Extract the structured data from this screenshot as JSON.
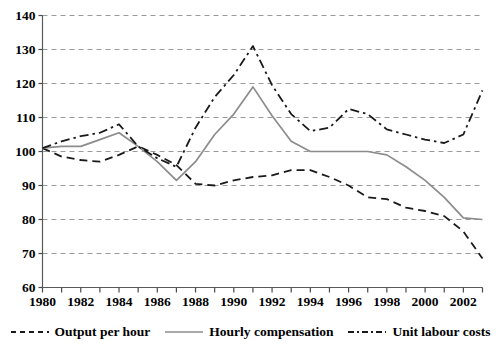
{
  "chart_data": {
    "type": "line",
    "title": "",
    "subtitle": "",
    "xlabel": "",
    "ylabel": "",
    "xlim": [
      1980,
      2003
    ],
    "ylim": [
      60,
      140
    ],
    "ytick_values": [
      60,
      70,
      80,
      90,
      100,
      110,
      120,
      130,
      140
    ],
    "ytick_labels": [
      "60",
      "70",
      "80",
      "90",
      "100",
      "110",
      "120",
      "130",
      "140"
    ],
    "xtick_values": [
      1980,
      1982,
      1984,
      1986,
      1988,
      1990,
      1992,
      1994,
      1996,
      1998,
      2000,
      2002
    ],
    "xtick_labels": [
      "1980",
      "1982",
      "1984",
      "1986",
      "1988",
      "1990",
      "1992",
      "1994",
      "1996",
      "1998",
      "2000",
      "2002"
    ],
    "x": [
      1980,
      1981,
      1982,
      1983,
      1984,
      1985,
      1986,
      1987,
      1988,
      1989,
      1990,
      1991,
      1992,
      1993,
      1994,
      1995,
      1996,
      1997,
      1998,
      1999,
      2000,
      2001,
      2002,
      2003
    ],
    "grid": true,
    "grid_axis": "y",
    "grid_style": "dashed",
    "legend_position": "bottom",
    "series": [
      {
        "name": "Output per hour",
        "style": "dashed",
        "color": "#1a1a1a",
        "values": [
          101,
          98.5,
          97.5,
          97,
          99,
          101.5,
          99,
          96,
          90.5,
          90,
          91.5,
          92.5,
          93,
          94.5,
          94.5,
          92.5,
          90,
          86.5,
          86,
          83.5,
          82.5,
          81,
          76.5,
          68.5
        ]
      },
      {
        "name": "Hourly compensation",
        "style": "solid",
        "color": "#8c8c8c",
        "values": [
          101,
          101.5,
          101.5,
          103.5,
          105.5,
          101.5,
          97,
          91.5,
          97,
          105,
          111,
          119,
          110.5,
          103,
          100,
          100,
          100,
          100,
          99,
          95.5,
          91.5,
          86.5,
          80.5,
          80
        ]
      },
      {
        "name": "Unit labour costs",
        "style": "dashdot",
        "color": "#1a1a1a",
        "values": [
          101,
          103,
          104.5,
          105.5,
          108,
          101.5,
          98,
          95.5,
          107,
          116,
          122.5,
          131,
          119.5,
          111,
          106,
          107,
          112.5,
          111,
          106.5,
          105,
          103.5,
          102.5,
          105,
          118
        ]
      }
    ]
  },
  "legend": {
    "items": [
      {
        "label": "Output per hour",
        "style": "dashed",
        "color": "#1a1a1a"
      },
      {
        "label": "Hourly compensation",
        "style": "solid",
        "color": "#8c8c8c"
      },
      {
        "label": "Unit labour costs",
        "style": "dashdot",
        "color": "#1a1a1a"
      }
    ]
  },
  "axes": {
    "frame_color": "#5a5a5a",
    "grid_color": "#9a9a9a",
    "tick_color": "#4a4a4a"
  }
}
